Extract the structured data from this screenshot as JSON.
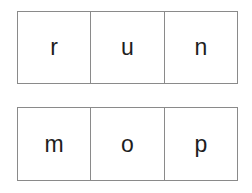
{
  "rows": [
    {
      "letters": [
        "r",
        "u",
        "n"
      ]
    },
    {
      "letters": [
        "m",
        "o",
        "p"
      ]
    }
  ]
}
